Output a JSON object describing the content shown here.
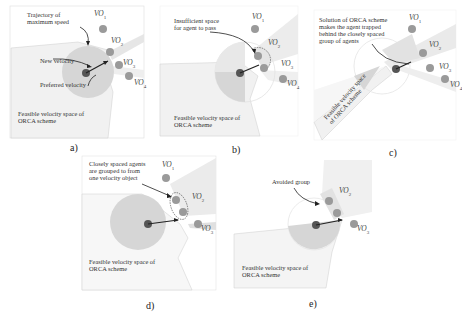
{
  "figure": {
    "page_number_fragment": "",
    "panels": [
      {
        "id": "a",
        "caption": "a)",
        "annotations": {
          "trajectory": "Trajectory of\nmaximum speed",
          "new_velocity": "New velocity",
          "preferred_velocity": "Preferred velocity",
          "feasible": "Feasible velocity space of\nORCA scheme"
        },
        "obstacles": [
          "VO1",
          "VO2",
          "VO3",
          "VO4"
        ]
      },
      {
        "id": "b",
        "caption": "b)",
        "annotations": {
          "insufficient": "Insufficient space\nfor agent to pass",
          "feasible": "Feasible velocity space of\nORCA scheme"
        },
        "obstacles": [
          "VO1",
          "VO2",
          "VO3",
          "VO4"
        ]
      },
      {
        "id": "c",
        "caption": "c)",
        "annotations": {
          "solution": "Solution of ORCA scheme\nmakes the agent trapped\nbehind the closely spaced\ngroup of agents",
          "feasible": "Feasible velocity space\nof ORCA scheme"
        },
        "obstacles": [
          "VO1",
          "VO2",
          "VO3",
          "VO4"
        ]
      },
      {
        "id": "d",
        "caption": "d)",
        "annotations": {
          "grouped": "Closely spaced agents\nare grouped to from\none velocity object",
          "feasible": "Feasible velocity space of\nORCA scheme"
        },
        "obstacles": [
          "VO1",
          "VO2",
          "VO3"
        ]
      },
      {
        "id": "e",
        "caption": "e)",
        "annotations": {
          "avoided": "Avoided group",
          "feasible": "Feasible velocity space of\nORCA scheme"
        },
        "obstacles": [
          "VO2",
          "VO3"
        ]
      }
    ],
    "colors": {
      "feasible_fill": "#f1f1f1",
      "velocity_disc": "#d6d6d6",
      "agent": "#555555",
      "neighbor": "#9a9a9a",
      "vo_cone": "#e4e4e4",
      "frame": "#dddddd"
    }
  }
}
